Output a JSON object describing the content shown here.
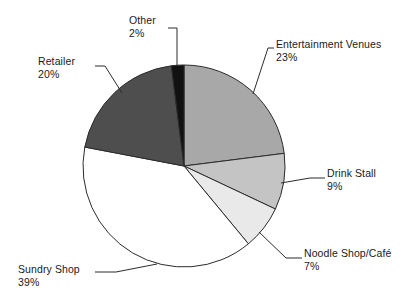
{
  "chart_data": {
    "type": "pie",
    "title": "",
    "subtitle": "",
    "xlabel": "",
    "ylabel": "",
    "legend_position": "none",
    "grid": false,
    "labels_outside": true,
    "leader_lines": true,
    "start_angle_deg": 0,
    "direction": "clockwise",
    "categories": [
      "Entertainment Venues",
      "Drink Stall",
      "Noodle Shop/Café",
      "Sundry Shop",
      "Retailer",
      "Other"
    ],
    "values": [
      23,
      9,
      7,
      39,
      20,
      2
    ],
    "value_labels": [
      "23%",
      "9%",
      "7%",
      "39%",
      "20%",
      "2%"
    ],
    "units": "percent",
    "total": 100,
    "slices": [
      {
        "name": "Entertainment Venues",
        "value": 23,
        "value_label": "23%",
        "color": "#a8a8a8",
        "label_name": "Entertainment Venues",
        "label_value": "23%"
      },
      {
        "name": "Drink Stall",
        "value": 9,
        "value_label": "9%",
        "color": "#c4c4c4",
        "label_name": "Drink Stall",
        "label_value": "9%"
      },
      {
        "name": "Noodle Shop/Café",
        "value": 7,
        "value_label": "7%",
        "color": "#e9e9e9",
        "label_name": "Noodle Shop/Café",
        "label_value": "7%"
      },
      {
        "name": "Sundry Shop",
        "value": 39,
        "value_label": "39%",
        "color": "#ffffff",
        "label_name": "Sundry Shop",
        "label_value": "39%"
      },
      {
        "name": "Retailer",
        "value": 20,
        "value_label": "20%",
        "color": "#4e4e4e",
        "label_name": "Retailer",
        "label_value": "20%"
      },
      {
        "name": "Other",
        "value": 2,
        "value_label": "2%",
        "color": "#111111",
        "label_name": "Other",
        "label_value": "2%"
      }
    ],
    "colors": {
      "outline": "#2b2b2b",
      "background": "#ffffff",
      "text": "#1a1a1a"
    }
  }
}
